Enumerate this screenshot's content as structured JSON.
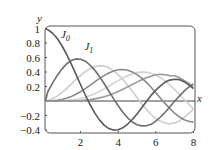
{
  "chart_data": {
    "type": "line",
    "title": "",
    "xlabel": "x",
    "ylabel": "y",
    "xlim": [
      0,
      8
    ],
    "ylim": [
      -0.4,
      1
    ],
    "grid": false,
    "x_ticks": [
      2,
      4,
      6,
      8
    ],
    "y_ticks": [
      1,
      0.8,
      0.6,
      0.4,
      0.2,
      -0.2,
      -0.4
    ],
    "y_tick_labels": [
      "1",
      "0.8",
      "0.6",
      "0.4",
      "0.2",
      "−0.2",
      "−0.4"
    ],
    "x_tick_labels": [
      "2",
      "4",
      "6",
      "8"
    ],
    "annotations": [
      {
        "text": "J",
        "sub": "0",
        "x": 0.95,
        "y": 0.87
      },
      {
        "text": "J",
        "sub": "1",
        "x": 2.2,
        "y": 0.7
      }
    ],
    "x": [
      0,
      0.25,
      0.5,
      0.75,
      1,
      1.25,
      1.5,
      1.75,
      2,
      2.25,
      2.5,
      2.75,
      3,
      3.25,
      3.5,
      3.75,
      4,
      4.25,
      4.5,
      4.75,
      5,
      5.25,
      5.5,
      5.75,
      6,
      6.25,
      6.5,
      6.75,
      7,
      7.25,
      7.5,
      7.75,
      8
    ],
    "series": [
      {
        "name": "J0",
        "color": "#5a5a5a",
        "values": [
          1,
          0.9844,
          0.9385,
          0.8642,
          0.7652,
          0.6459,
          0.5118,
          0.369,
          0.2239,
          0.0827,
          -0.0484,
          -0.1641,
          -0.2601,
          -0.3328,
          -0.3801,
          -0.4014,
          -0.3971,
          -0.3692,
          -0.3205,
          -0.2551,
          -0.1776,
          -0.0933,
          -0.0068,
          0.0768,
          0.1506,
          0.2097,
          0.2601,
          0.2877,
          0.3001,
          0.295,
          0.2663,
          0.2224,
          0.1717
        ]
      },
      {
        "name": "J1",
        "color": "#6e6e6e",
        "values": [
          0,
          0.124,
          0.2423,
          0.3492,
          0.4401,
          0.5106,
          0.5579,
          0.5802,
          0.5767,
          0.5484,
          0.4971,
          0.426,
          0.3391,
          0.2411,
          0.1374,
          0.0332,
          -0.066,
          -0.1549,
          -0.2311,
          -0.2892,
          -0.3276,
          -0.3432,
          -0.3414,
          -0.3209,
          -0.2767,
          -0.2213,
          -0.1538,
          -0.0802,
          -0.0047,
          0.0674,
          0.1352,
          0.1916,
          0.2346
        ]
      },
      {
        "name": "J2",
        "color": "#cdcdcd",
        "values": [
          0,
          0.0078,
          0.0306,
          0.0671,
          0.1149,
          0.1711,
          0.2321,
          0.294,
          0.3528,
          0.4047,
          0.4461,
          0.474,
          0.4861,
          0.4812,
          0.4586,
          0.4191,
          0.3641,
          0.2963,
          0.2178,
          0.1339,
          0.0466,
          -0.0398,
          -0.1173,
          -0.1866,
          -0.2429,
          -0.2806,
          -0.3074,
          -0.3136,
          -0.3014,
          -0.2748,
          -0.2303,
          -0.1735,
          -0.113
        ]
      },
      {
        "name": "J3",
        "color": "#8a8a8a",
        "values": [
          0,
          0.0003,
          0.0026,
          0.0085,
          0.0196,
          0.0369,
          0.061,
          0.0919,
          0.1289,
          0.1711,
          0.2166,
          0.2634,
          0.3091,
          0.3505,
          0.3868,
          0.4133,
          0.4302,
          0.4342,
          0.4247,
          0.4017,
          0.3648,
          0.3159,
          0.2561,
          0.1883,
          0.1148,
          0.039,
          -0.0353,
          -0.1048,
          -0.1676,
          -0.218,
          -0.2581,
          -0.2796,
          -0.2911
        ]
      },
      {
        "name": "J4",
        "color": "#d2d2d2",
        "values": [
          0,
          0,
          0.0002,
          0.0008,
          0.0025,
          0.0059,
          0.0118,
          0.0209,
          0.034,
          0.0514,
          0.0738,
          0.1011,
          0.132,
          0.1671,
          0.2044,
          0.2425,
          0.2811,
          0.3167,
          0.3484,
          0.3736,
          0.3912,
          0.3993,
          0.3967,
          0.3834,
          0.3576,
          0.3219,
          0.2748,
          0.2209,
          0.1578,
          0.0923,
          0.0238,
          -0.0432,
          -0.1054
        ]
      },
      {
        "name": "J5",
        "color": "#9a9a9a",
        "values": [
          0,
          0,
          0,
          0.0001,
          0.0002,
          0.0007,
          0.0018,
          0.0038,
          0.007,
          0.0118,
          0.0195,
          0.0296,
          0.043,
          0.06,
          0.0804,
          0.1043,
          0.1321,
          0.1613,
          0.1947,
          0.2281,
          0.2611,
          0.2918,
          0.3209,
          0.3418,
          0.3621,
          0.3691,
          0.362,
          0.35,
          0.3479,
          0.3231,
          0.2835,
          0.2454,
          0.1858
        ]
      }
    ]
  }
}
